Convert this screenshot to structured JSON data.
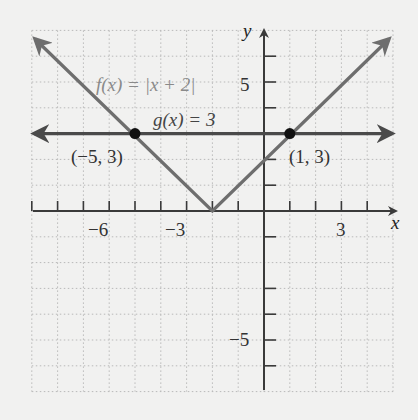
{
  "chart_data": {
    "type": "line",
    "title": "",
    "xlabel": "x",
    "ylabel": "y",
    "xlim": [
      -9,
      5
    ],
    "ylim": [
      -7,
      7
    ],
    "grid": true,
    "x_ticks": [
      -9,
      -8,
      -7,
      -6,
      -5,
      -4,
      -3,
      -2,
      -1,
      1,
      2,
      3,
      4
    ],
    "x_tick_labels": [
      {
        "value": -6,
        "label": "−6"
      },
      {
        "value": -3,
        "label": "−3"
      },
      {
        "value": 3,
        "label": "3"
      }
    ],
    "y_ticks": [
      -6,
      -5,
      -4,
      -3,
      -1,
      1,
      2,
      3,
      4,
      5,
      6
    ],
    "y_tick_labels": [
      {
        "value": 5,
        "label": "5"
      },
      {
        "value": -5,
        "label": "−5"
      }
    ],
    "series": [
      {
        "name": "f(x) = |x + 2|",
        "kind": "absolute-value",
        "color": "#6e6e6e",
        "points": [
          [
            -9,
            7
          ],
          [
            -2,
            0
          ],
          [
            5,
            7
          ]
        ]
      },
      {
        "name": "g(x) = 3",
        "kind": "horizontal-line",
        "color": "#4a4a4a",
        "points": [
          [
            -9,
            3
          ],
          [
            5,
            3
          ]
        ]
      }
    ],
    "intersections": [
      {
        "x": -5,
        "y": 3,
        "label": "(−5, 3)"
      },
      {
        "x": 1,
        "y": 3,
        "label": "(1, 3)"
      }
    ],
    "annotations": [
      {
        "text": "f(x) = |x + 2|",
        "near": [
          -3.5,
          5
        ]
      },
      {
        "text": "g(x) = 3",
        "near": [
          -1.5,
          3.8
        ]
      }
    ]
  },
  "labels": {
    "x_axis": "x",
    "y_axis": "y",
    "f_label": "f(x) = |x + 2|",
    "g_label": "g(x) = 3",
    "pt1": "(−5, 3)",
    "pt2": "(1, 3)",
    "xt_m6": "−6",
    "xt_m3": "−3",
    "xt_3": "3",
    "yt_5": "5",
    "yt_m5": "−5"
  },
  "colors": {
    "background": "#f1f1f0",
    "axis": "#3a3a3a",
    "f_line": "#6e6e6e",
    "g_line": "#4a4a4a",
    "point": "#111111",
    "grid": "#b9b9b9"
  }
}
